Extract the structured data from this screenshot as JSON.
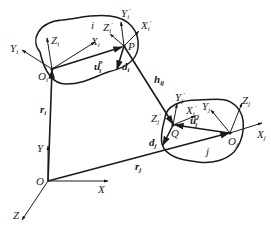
{
  "diagram": {
    "global_frame": {
      "origin": "O",
      "axes": {
        "x": "X",
        "y": "Y",
        "z": "Z"
      }
    },
    "body_i": {
      "name": "i",
      "origin": {
        "main": "O",
        "sub": "i"
      },
      "axes": {
        "x": {
          "main": "X",
          "sub": "i"
        },
        "y": {
          "main": "Y",
          "sub": "i"
        },
        "z": {
          "main": "Z",
          "sub": "i"
        }
      },
      "point": "P",
      "point_axes": {
        "x": {
          "main": "X",
          "sub": "i",
          "prime": "′"
        },
        "y": {
          "main": "Y",
          "sub": "i",
          "prime": "′"
        },
        "z": {
          "main": "Z",
          "sub": "i",
          "prime": "′"
        }
      },
      "vectors": {
        "position": {
          "main": "r",
          "sub": "i"
        },
        "local": {
          "main": "u",
          "sub": "i",
          "sup": "P"
        },
        "direction": {
          "main": "d",
          "sub": "i"
        }
      }
    },
    "body_j": {
      "name": "j",
      "origin": {
        "main": "O",
        "sub": "j"
      },
      "axes": {
        "x": {
          "main": "X",
          "sub": "j"
        },
        "y": {
          "main": "Y",
          "sub": "j"
        },
        "z": {
          "main": "Z",
          "sub": "j"
        }
      },
      "point": "Q",
      "point_axes": {
        "x": {
          "main": "X",
          "sub": "j",
          "prime": "′"
        },
        "y": {
          "main": "Y",
          "sub": "j",
          "prime": "′"
        },
        "z": {
          "main": "Z",
          "sub": "j",
          "prime": "′"
        }
      },
      "vectors": {
        "position": {
          "main": "r",
          "sub": "j"
        },
        "local": {
          "main": "u",
          "sub": "j",
          "sup": "Q"
        },
        "direction": {
          "main": "d",
          "sub": "j"
        }
      }
    },
    "connecting_vector": {
      "main": "h",
      "sub": "ij"
    }
  }
}
